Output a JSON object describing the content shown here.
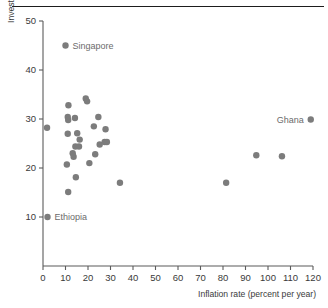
{
  "figure": {
    "background": "#ffffff",
    "marker_color": "#7c7c7c",
    "axis_color": "#5b5b5b",
    "label_color": "#6b6b6b",
    "rule_color": "#1d1d1d"
  },
  "chart_data": {
    "type": "scatter",
    "title": "",
    "xlabel": "Inflation rate (percent per year)",
    "ylabel": "Investment rate (percentage of GDP)",
    "xlim": [
      0,
      120
    ],
    "ylim": [
      0,
      50
    ],
    "xticks": [
      0,
      10,
      20,
      30,
      40,
      50,
      60,
      70,
      80,
      90,
      100,
      110,
      120
    ],
    "yticks": [
      10,
      20,
      30,
      40,
      50
    ],
    "xticklabels": [
      "0",
      "10",
      "20",
      "30",
      "40",
      "50",
      "60",
      "70",
      "80",
      "90",
      "100",
      "110",
      "120"
    ],
    "yticklabels": [
      "10",
      "20",
      "30",
      "40",
      "50"
    ],
    "grid": false,
    "legend": "none",
    "points": [
      {
        "x": 10.0,
        "y": 45.0,
        "label": "Singapore"
      },
      {
        "x": 2.0,
        "y": 10.0,
        "label": "Ethiopia"
      },
      {
        "x": 119.0,
        "y": 29.9,
        "label": "Ghana"
      },
      {
        "x": 1.8,
        "y": 28.2,
        "label": ""
      },
      {
        "x": 11.3,
        "y": 32.8,
        "label": ""
      },
      {
        "x": 19.0,
        "y": 34.2,
        "label": ""
      },
      {
        "x": 19.6,
        "y": 33.6,
        "label": ""
      },
      {
        "x": 11.0,
        "y": 30.4,
        "label": ""
      },
      {
        "x": 11.2,
        "y": 29.8,
        "label": ""
      },
      {
        "x": 14.2,
        "y": 30.2,
        "label": ""
      },
      {
        "x": 24.6,
        "y": 30.4,
        "label": ""
      },
      {
        "x": 11.0,
        "y": 27.0,
        "label": ""
      },
      {
        "x": 15.2,
        "y": 27.1,
        "label": ""
      },
      {
        "x": 22.6,
        "y": 28.5,
        "label": ""
      },
      {
        "x": 27.8,
        "y": 27.9,
        "label": ""
      },
      {
        "x": 16.3,
        "y": 25.8,
        "label": ""
      },
      {
        "x": 14.4,
        "y": 24.4,
        "label": ""
      },
      {
        "x": 16.0,
        "y": 24.4,
        "label": ""
      },
      {
        "x": 25.2,
        "y": 24.8,
        "label": ""
      },
      {
        "x": 27.4,
        "y": 25.3,
        "label": ""
      },
      {
        "x": 28.4,
        "y": 25.3,
        "label": ""
      },
      {
        "x": 13.2,
        "y": 23.0,
        "label": ""
      },
      {
        "x": 13.6,
        "y": 22.3,
        "label": ""
      },
      {
        "x": 23.2,
        "y": 22.8,
        "label": ""
      },
      {
        "x": 10.6,
        "y": 20.7,
        "label": ""
      },
      {
        "x": 20.6,
        "y": 21.0,
        "label": ""
      },
      {
        "x": 14.6,
        "y": 18.1,
        "label": ""
      },
      {
        "x": 11.2,
        "y": 15.1,
        "label": ""
      },
      {
        "x": 34.2,
        "y": 17.0,
        "label": ""
      },
      {
        "x": 81.4,
        "y": 17.0,
        "label": ""
      },
      {
        "x": 94.8,
        "y": 22.6,
        "label": ""
      },
      {
        "x": 106.2,
        "y": 22.4,
        "label": ""
      }
    ]
  }
}
